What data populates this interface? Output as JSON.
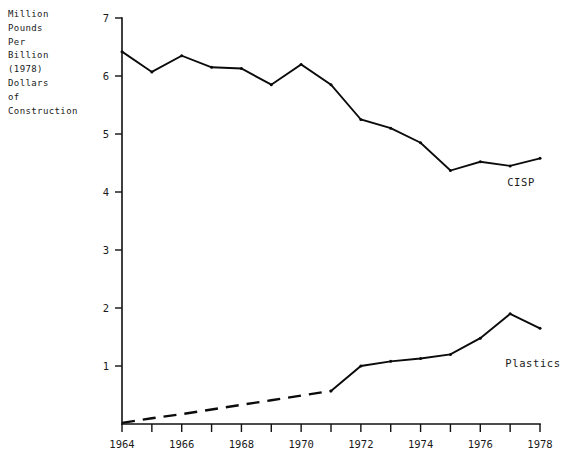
{
  "chart_data": {
    "type": "line",
    "title": "",
    "ylabel": "Million\nPounds\nPer\nBillion\n(1978)\nDollars\nof\nConstruction",
    "xlabel": "",
    "xlim": [
      1964,
      1978
    ],
    "ylim": [
      0,
      7
    ],
    "grid": false,
    "legend_position": "inline-right",
    "x": [
      1964,
      1965,
      1966,
      1967,
      1968,
      1969,
      1970,
      1971,
      1972,
      1973,
      1974,
      1975,
      1976,
      1977,
      1978
    ],
    "xtick_values": [
      1964,
      1965,
      1966,
      1967,
      1968,
      1969,
      1970,
      1971,
      1972,
      1973,
      1974,
      1975,
      1976,
      1977,
      1978
    ],
    "xtick_labels": [
      "1964",
      "",
      "1966",
      "",
      "1968",
      "",
      "1970",
      "",
      "1972",
      "",
      "1974",
      "",
      "1976",
      "",
      "1978"
    ],
    "ytick_values": [
      1,
      2,
      3,
      4,
      5,
      6,
      7
    ],
    "ytick_labels": [
      "1",
      "2",
      "3",
      "4",
      "5",
      "6",
      "7"
    ],
    "series": [
      {
        "name": "CISP",
        "label": "CISP",
        "style": "solid",
        "values": [
          6.42,
          6.07,
          6.35,
          6.15,
          6.13,
          5.85,
          6.2,
          5.85,
          5.25,
          5.1,
          4.85,
          4.37,
          4.52,
          4.45,
          4.58
        ]
      },
      {
        "name": "Plastics",
        "label": "Plastics",
        "style": "dashed-then-solid",
        "dashed_through_year": 1971,
        "values": [
          0.02,
          0.1,
          0.17,
          0.25,
          0.33,
          0.41,
          0.49,
          0.57,
          1.0,
          1.08,
          1.13,
          1.2,
          1.48,
          1.9,
          1.65
        ]
      }
    ]
  },
  "labels": {
    "y_axis_caption": "Million\nPounds\nPer\nBillion\n(1978)\nDollars\nof\nConstruction",
    "series_cisp": "CISP",
    "series_plastics": "Plastics"
  }
}
